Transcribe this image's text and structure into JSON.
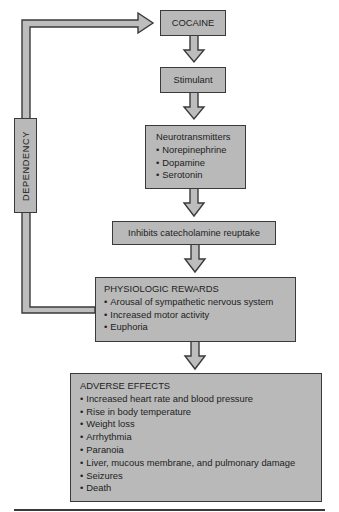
{
  "diagram": {
    "type": "flowchart",
    "fill_color": "#b9b9b9",
    "stroke_color": "#3a3a3a",
    "nodes": {
      "cocaine": {
        "label": "COCAINE"
      },
      "stimulant": {
        "label": "Stimulant"
      },
      "neurotransmitters": {
        "title": "Neurotransmitters",
        "items": [
          "Norepinephrine",
          "Dopamine",
          "Serotonin"
        ]
      },
      "inhibits": {
        "label": "Inhibits catecholamine reuptake"
      },
      "physiologic_rewards": {
        "title": "PHYSIOLOGIC REWARDS",
        "items": [
          "Arousal of sympathetic nervous system",
          "Increased motor activity",
          "Euphoria"
        ]
      },
      "adverse_effects": {
        "title": "ADVERSE EFFECTS",
        "items": [
          "Increased heart rate and blood pressure",
          "Rise in body temperature",
          "Weight loss",
          "Arrhythmia",
          "Paranoia",
          "Liver, mucous membrane, and pulmonary damage",
          "Seizures",
          "Death"
        ]
      }
    },
    "feedback_loop": {
      "label": "DEPENDENCY",
      "from": "physiologic_rewards",
      "to": "cocaine"
    },
    "edges": [
      [
        "cocaine",
        "stimulant"
      ],
      [
        "stimulant",
        "neurotransmitters"
      ],
      [
        "neurotransmitters",
        "inhibits"
      ],
      [
        "inhibits",
        "physiologic_rewards"
      ],
      [
        "physiologic_rewards",
        "adverse_effects"
      ],
      [
        "physiologic_rewards",
        "cocaine"
      ]
    ]
  }
}
